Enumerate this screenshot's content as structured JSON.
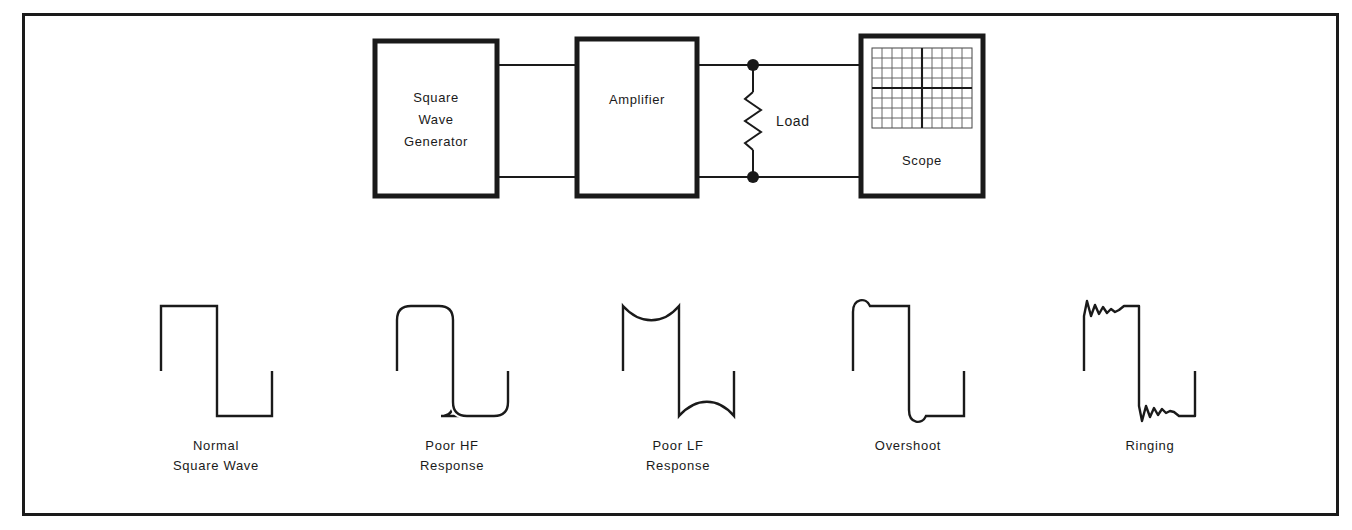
{
  "figure": {
    "border_color": "#1a1a1a",
    "line_color": "#1a1a1a",
    "background": "#ffffff"
  },
  "block_diagram": {
    "generator": {
      "name": "square-wave-generator-block",
      "label_lines": [
        "Square",
        "Wave",
        "Generator"
      ]
    },
    "amplifier": {
      "name": "amplifier-block",
      "label": "Amplifier"
    },
    "load": {
      "name": "load-resistor",
      "label": "Load",
      "symbol": "zigzag-resistor"
    },
    "scope": {
      "name": "scope-block",
      "label": "Scope",
      "graticule": {
        "columns": 10,
        "rows": 8,
        "center_axes": true
      }
    },
    "junction_dots": 2,
    "wires": {
      "top_label": "signal-top",
      "bottom_label": "signal-return"
    }
  },
  "waveforms": [
    {
      "id": "normal",
      "name": "waveform-normal-square-wave",
      "caption_lines": [
        "Normal",
        "Square Wave"
      ],
      "description": "ideal square wave, sharp corners, flat top and bottom"
    },
    {
      "id": "poor-hf",
      "name": "waveform-poor-hf-response",
      "caption_lines": [
        "Poor HF",
        "Response"
      ],
      "description": "rounded corners from attenuated high frequencies"
    },
    {
      "id": "poor-lf",
      "name": "waveform-poor-lf-response",
      "caption_lines": [
        "Poor LF",
        "Response"
      ],
      "description": "sagging tops and bottoms from attenuated low frequencies"
    },
    {
      "id": "overshoot",
      "name": "waveform-overshoot",
      "caption_lines": [
        "Overshoot"
      ],
      "description": "single bump past final level after each transition"
    },
    {
      "id": "ringing",
      "name": "waveform-ringing",
      "caption_lines": [
        "Ringing"
      ],
      "description": "decaying oscillation after each transition"
    }
  ]
}
